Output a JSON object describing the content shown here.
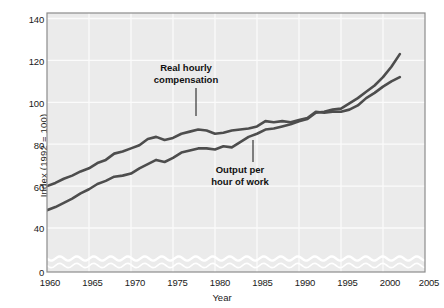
{
  "chart_data": {
    "type": "line",
    "title": "",
    "xlabel": "Year",
    "ylabel": "Index (1992 = 100)",
    "xlim": [
      1960,
      2005
    ],
    "ylim": [
      0,
      140
    ],
    "y_axis_break": true,
    "y_break_range": [
      2,
      33
    ],
    "grid": true,
    "legend": "annotations on plot",
    "xticks": [
      1960,
      1965,
      1970,
      1975,
      1980,
      1985,
      1990,
      1995,
      2000,
      2005
    ],
    "yticks": [
      0,
      40,
      60,
      80,
      100,
      120,
      140
    ],
    "series": [
      {
        "name": "Output per hour of work",
        "color": "#4d4d4d",
        "x": [
          1960,
          1961,
          1962,
          1963,
          1964,
          1965,
          1966,
          1967,
          1968,
          1969,
          1970,
          1971,
          1972,
          1973,
          1974,
          1975,
          1976,
          1977,
          1978,
          1979,
          1980,
          1981,
          1982,
          1983,
          1984,
          1985,
          1986,
          1987,
          1988,
          1989,
          1990,
          1991,
          1992,
          1993,
          1994,
          1995,
          1996,
          1997,
          1998,
          1999,
          2000,
          2001,
          2002
        ],
        "values": [
          48.5,
          50.0,
          52.0,
          54.0,
          56.5,
          58.5,
          61.0,
          62.5,
          64.5,
          65.0,
          66.0,
          68.5,
          70.5,
          72.5,
          71.5,
          73.5,
          76.0,
          77.0,
          78.0,
          78.0,
          77.5,
          79.0,
          78.5,
          81.0,
          83.5,
          85.0,
          87.0,
          87.5,
          88.5,
          89.5,
          91.0,
          92.0,
          95.0,
          95.5,
          96.5,
          97.0,
          99.5,
          102.0,
          105.0,
          108.0,
          112.0,
          117.0,
          123.0
        ]
      },
      {
        "name": "Real hourly compensation",
        "color": "#4d4d4d",
        "x": [
          1960,
          1961,
          1962,
          1963,
          1964,
          1965,
          1966,
          1967,
          1968,
          1969,
          1970,
          1971,
          1972,
          1973,
          1974,
          1975,
          1976,
          1977,
          1978,
          1979,
          1980,
          1981,
          1982,
          1983,
          1984,
          1985,
          1986,
          1987,
          1988,
          1989,
          1990,
          1991,
          1992,
          1993,
          1994,
          1995,
          1996,
          1997,
          1998,
          1999,
          2000,
          2001,
          2002
        ],
        "values": [
          60.0,
          61.5,
          63.5,
          65.0,
          67.0,
          68.5,
          71.0,
          72.5,
          75.5,
          76.5,
          78.0,
          79.5,
          82.5,
          83.5,
          82.0,
          83.0,
          85.0,
          86.0,
          87.0,
          86.5,
          85.0,
          85.5,
          86.5,
          87.0,
          87.5,
          88.5,
          91.0,
          90.5,
          91.0,
          90.5,
          91.5,
          92.5,
          95.5,
          95.0,
          95.5,
          95.5,
          96.5,
          98.5,
          102.0,
          104.5,
          107.5,
          110.0,
          112.0
        ]
      }
    ],
    "annotations": [
      {
        "text_line1": "Real hourly",
        "text_line2": "compensation",
        "points_to_series": "Real hourly compensation"
      },
      {
        "text_line1": "Output per",
        "text_line2": "hour of work",
        "points_to_series": "Output per hour of work"
      }
    ]
  },
  "axis": {
    "ylabel": "Index (1992 = 100)",
    "xlabel": "Year",
    "yticks": [
      "0",
      "40",
      "60",
      "80",
      "100",
      "120",
      "140"
    ],
    "xticks": [
      "1960",
      "1965",
      "1970",
      "1975",
      "1980",
      "1985",
      "1990",
      "1995",
      "2000",
      "2005"
    ]
  },
  "annotations": {
    "real_hourly_l1": "Real hourly",
    "real_hourly_l2": "compensation",
    "output_l1": "Output per",
    "output_l2": "hour of work"
  },
  "colors": {
    "plot_background": "#ebebeb",
    "line": "#4d4d4d",
    "grid": "#fafafa",
    "frame": "#8c8c8c",
    "text": "#1a1a1a"
  }
}
